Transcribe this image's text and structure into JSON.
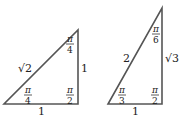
{
  "triangles": [
    {
      "name": "45-45-90 triangle",
      "sides": {
        "hypotenuse": "√2",
        "vertical": "1",
        "base": "1"
      },
      "angles": {
        "top": {
          "num": "π",
          "den": "4"
        },
        "bottom_left": {
          "num": "π",
          "den": "4"
        },
        "right_angle": {
          "num": "π",
          "den": "2"
        }
      }
    },
    {
      "name": "30-60-90 triangle",
      "sides": {
        "hypotenuse": "2",
        "vertical": "√3",
        "base": "1"
      },
      "angles": {
        "top": {
          "num": "π",
          "den": "6"
        },
        "bottom_left": {
          "num": "π",
          "den": "3"
        },
        "right_angle": {
          "num": "π",
          "den": "2"
        }
      }
    }
  ],
  "colors": {
    "stroke": "#555555",
    "text": "#222222"
  }
}
